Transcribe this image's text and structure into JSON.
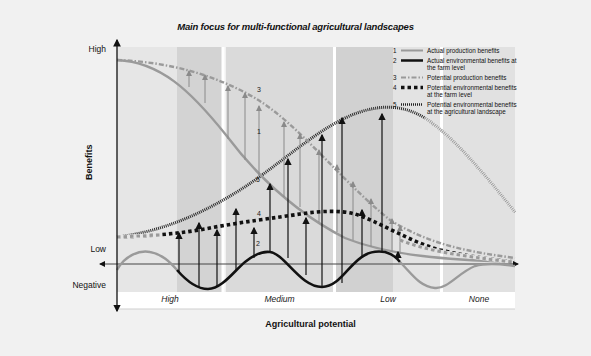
{
  "title": "Main focus for multi-functional agricultural landscapes",
  "y_axis": {
    "title": "Benefits",
    "ticks": [
      "High",
      "Low",
      "Negative"
    ]
  },
  "x_axis": {
    "title": "Agricultural potential",
    "categories": [
      "High",
      "Medium",
      "Low",
      "None"
    ]
  },
  "legend": [
    {
      "num": "1",
      "label": "Actual production benefits",
      "style": "solid-grey"
    },
    {
      "num": "2",
      "label": "Actual environmental benefits at the farm level",
      "style": "solid-black"
    },
    {
      "num": "3",
      "label": "Potential production benefits",
      "style": "dash-dot-grey"
    },
    {
      "num": "4",
      "label": "Potential environmental benefits at the farm level",
      "style": "square-dotted-black"
    },
    {
      "num": "5",
      "label": "Potential environmental benefits at the agricultural landscape",
      "style": "fine-dotted-black"
    }
  ],
  "curve_labels": {
    "c1": "1",
    "c2": "2",
    "c3": "3",
    "c4": "4",
    "c5": "5"
  },
  "colors": {
    "background": "#f1f1f1",
    "panel_light": "#e4e4e4",
    "panel_dark": "#d2d2d2",
    "grey_curve": "#9a9a9a",
    "black_curve": "#111111"
  }
}
